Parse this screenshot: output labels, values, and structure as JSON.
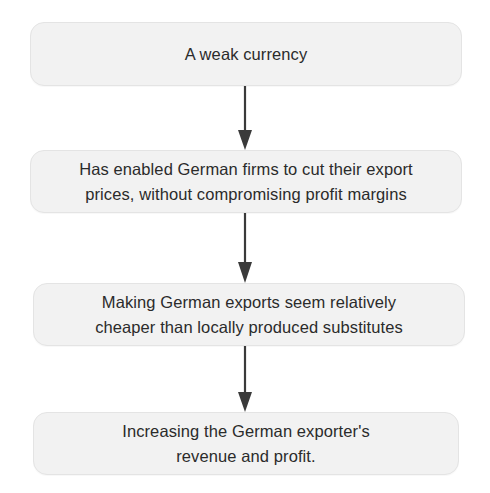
{
  "diagram": {
    "type": "vertical-flowchart",
    "background_color": "#ffffff",
    "node_fill_color": "#f2f2f2",
    "node_border_color": "#e4e4e4",
    "text_color": "#2b2b2b",
    "arrow_color": "#3a3a3a",
    "nodes": [
      {
        "id": "node-1",
        "label": "A weak currency"
      },
      {
        "id": "node-2",
        "label": "Has enabled German firms to cut their export\nprices, without compromising profit margins"
      },
      {
        "id": "node-3",
        "label": "Making German exports seem relatively\ncheaper than locally produced substitutes"
      },
      {
        "id": "node-4",
        "label": "Increasing the German exporter's\nrevenue and profit."
      }
    ],
    "arrows": [
      {
        "id": "arrow-1",
        "from": "node-1",
        "to": "node-2",
        "direction": "down"
      },
      {
        "id": "arrow-2",
        "from": "node-2",
        "to": "node-3",
        "direction": "down"
      },
      {
        "id": "arrow-3",
        "from": "node-3",
        "to": "node-4",
        "direction": "down"
      }
    ]
  }
}
